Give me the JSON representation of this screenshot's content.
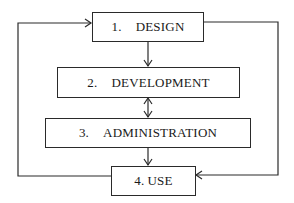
{
  "diagram": {
    "type": "flowchart-cycle",
    "nodes": [
      {
        "id": "design",
        "number": "1.",
        "label": "DESIGN"
      },
      {
        "id": "development",
        "number": "2.",
        "label": "DEVELOPMENT"
      },
      {
        "id": "administration",
        "number": "3.",
        "label": "ADMINISTRATION"
      },
      {
        "id": "use",
        "number": "4.",
        "label": "USE"
      }
    ],
    "edges": [
      {
        "from": "design",
        "to": "development",
        "direction": "one-way"
      },
      {
        "from": "development",
        "to": "administration",
        "direction": "two-way"
      },
      {
        "from": "administration",
        "to": "use",
        "direction": "one-way"
      },
      {
        "from": "use",
        "to": "design",
        "direction": "one-way",
        "route": "left-loop"
      },
      {
        "from": "design",
        "to": "use",
        "direction": "one-way",
        "route": "right-loop"
      }
    ],
    "colors": {
      "line": "#2a2a2a",
      "text": "#1a1a1a",
      "background": "#ffffff"
    }
  }
}
